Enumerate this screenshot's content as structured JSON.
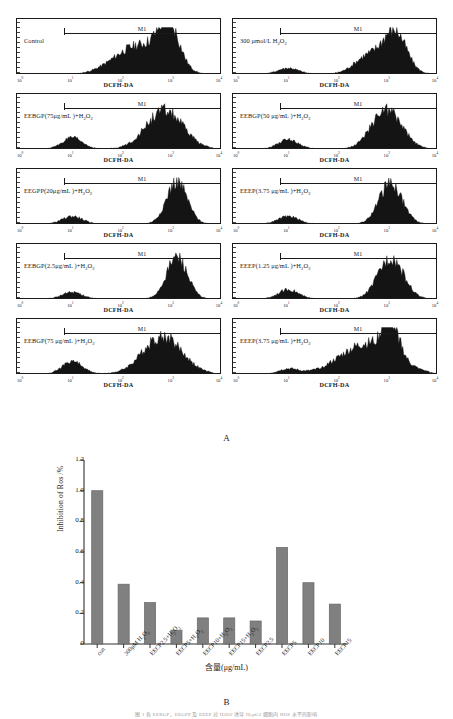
{
  "figure": {
    "panel_a_letter": "A",
    "panel_b_letter": "B",
    "bottom_caption": "图 1  各 EEBGP、EEGPP 及 EEEP 对 H2O2 诱导 HepG2 细胞内 ROS 水平的影响"
  },
  "flow_panels": {
    "x_title": "DCFH-DA",
    "marker_label": "M1",
    "x_ticks": [
      {
        "label": "10",
        "exp": "0",
        "pos": 2
      },
      {
        "label": "10",
        "exp": "1",
        "pos": 26.5
      },
      {
        "label": "10",
        "exp": "2",
        "pos": 51
      },
      {
        "label": "10",
        "exp": "3",
        "pos": 75.5
      },
      {
        "label": "10",
        "exp": "4",
        "pos": 99
      }
    ],
    "panels": [
      {
        "id": "control",
        "label": "Control",
        "label_html": "Control",
        "marker_start": 23,
        "marker_end": 99,
        "peaks": [
          {
            "c": 60,
            "w": 22,
            "h": 0.7
          },
          {
            "c": 74,
            "w": 9,
            "h": 0.95
          }
        ],
        "baseline_left": 0.0,
        "left_hump": 0.0
      },
      {
        "id": "h2o2-300",
        "label": "300 μmol/L H2O2",
        "label_html": "300 μmol/L  H<sub>2</sub>O<sub>2</sub>",
        "marker_start": 23,
        "marker_end": 99,
        "peaks": [
          {
            "c": 79,
            "w": 10,
            "h": 0.98
          },
          {
            "c": 66,
            "w": 12,
            "h": 0.42
          }
        ],
        "baseline_left": 0.04,
        "left_hump": 0.14
      },
      {
        "id": "eebgp-75",
        "label": "EEBGP(75μg/mL)+H2O2",
        "label_html": "EEBGP(75μg/mL )+H<sub>2</sub>O<sub>2</sub>",
        "marker_start": 23,
        "marker_end": 99,
        "peaks": [
          {
            "c": 72,
            "w": 16,
            "h": 0.9
          }
        ],
        "baseline_left": 0.04,
        "left_hump": 0.26
      },
      {
        "id": "eebgp-50",
        "label": "EEBGP(50μg/mL)+H2O2",
        "label_html": "EEBGP(50 μg/mL )+H<sub>2</sub>O<sub>2</sub>",
        "marker_start": 23,
        "marker_end": 99,
        "peaks": [
          {
            "c": 75,
            "w": 13,
            "h": 0.93
          }
        ],
        "baseline_left": 0.04,
        "left_hump": 0.22
      },
      {
        "id": "eegpp-20",
        "label": "EEGPP(20μg/mL)+H2O2",
        "label_html": "EEGPP(20μg/mL )+H<sub>2</sub>O<sub>2</sub>",
        "marker_start": 23,
        "marker_end": 99,
        "peaks": [
          {
            "c": 78,
            "w": 9,
            "h": 0.99
          }
        ],
        "baseline_left": 0.04,
        "left_hump": 0.18
      },
      {
        "id": "eeep-3.75-a",
        "label": "EEEP(3.75 μg/mL)+H2O2",
        "label_html": "EEEP(3.75 μg/mL )+H<sub>2</sub>O<sub>2</sub>",
        "marker_start": 23,
        "marker_end": 99,
        "peaks": [
          {
            "c": 77,
            "w": 10,
            "h": 0.96
          }
        ],
        "baseline_left": 0.04,
        "left_hump": 0.18
      },
      {
        "id": "eebgp-2.5",
        "label": "EEBGP(2.5μg/mL)+H2O2",
        "label_html": "EEBGP(2.5μg/mL )+H<sub>2</sub>O<sub>2</sub>",
        "marker_start": 23,
        "marker_end": 99,
        "peaks": [
          {
            "c": 78,
            "w": 9,
            "h": 0.98
          }
        ],
        "baseline_left": 0.04,
        "left_hump": 0.16
      },
      {
        "id": "eeep-1.25",
        "label": "EEEP(1.25 μg/mL)+H2O2",
        "label_html": "EEEP(1.25 μg/mL )+H<sub>2</sub>O<sub>2</sub>",
        "marker_start": 23,
        "marker_end": 99,
        "peaks": [
          {
            "c": 77,
            "w": 11,
            "h": 0.97
          }
        ],
        "baseline_left": 0.04,
        "left_hump": 0.22
      },
      {
        "id": "eebgp-75-b",
        "label": "EEBGP(75 μg/mL )+H2O2",
        "label_html": "EEBGP(75 μg/mL )+H<sub>2</sub>O<sub>2</sub>",
        "marker_start": 23,
        "marker_end": 99,
        "peaks": [
          {
            "c": 71,
            "w": 17,
            "h": 0.88
          }
        ],
        "baseline_left": 0.04,
        "left_hump": 0.3
      },
      {
        "id": "eeep-3.75-b",
        "label": "EEEP(3.75 μg/mL )+H2O2",
        "label_html": "EEEP(3.75 μg/mL )+H<sub>2</sub>O<sub>2</sub>",
        "marker_start": 23,
        "marker_end": 99,
        "peaks": [
          {
            "c": 66,
            "w": 24,
            "h": 0.72
          },
          {
            "c": 77,
            "w": 7,
            "h": 0.8
          }
        ],
        "baseline_left": 0.03,
        "left_hump": 0.12
      }
    ]
  },
  "chart_data": {
    "type": "bar",
    "title": "",
    "xlabel": "含量(μg/mL)",
    "ylabel": "Inhibition of Ros /%",
    "categories": [
      "con",
      "300μM H2O2",
      "EECP2.5+H2O2",
      "EECP5+H2O2",
      "EECP10+H2O2",
      "EECP15+H2O2",
      "EECP2.5",
      "EECP5",
      "EECP10",
      "EECP15"
    ],
    "categories_html": [
      "con",
      "300μM H<sub>2</sub>O<sub>2</sub>",
      "EECP2.5+H<sub>2</sub>O<sub>2</sub>",
      "EECP5+H<sub>2</sub>O<sub>2</sub>",
      "EECP10+H<sub>2</sub>O<sub>2</sub>",
      "EECP15+H<sub>2</sub>O<sub>2</sub>",
      "EECP2.5",
      "EECP5",
      "EECP10",
      "EECP15"
    ],
    "values": [
      1.0,
      0.39,
      0.27,
      0.09,
      0.17,
      0.17,
      0.15,
      0.63,
      0.4,
      0.26
    ],
    "ylim": [
      0,
      1.2
    ],
    "yticks": [
      0,
      0.2,
      0.4,
      0.6,
      0.8,
      1.0,
      1.2
    ],
    "ytick_labels": [
      "0",
      "0.2",
      "0.4",
      "0.6",
      "0.8",
      "1.0",
      "1.2"
    ],
    "bar_color": "#808080",
    "bar_edge_color": "#666666",
    "axis_color": "#333333",
    "grid": false,
    "legend": false
  }
}
